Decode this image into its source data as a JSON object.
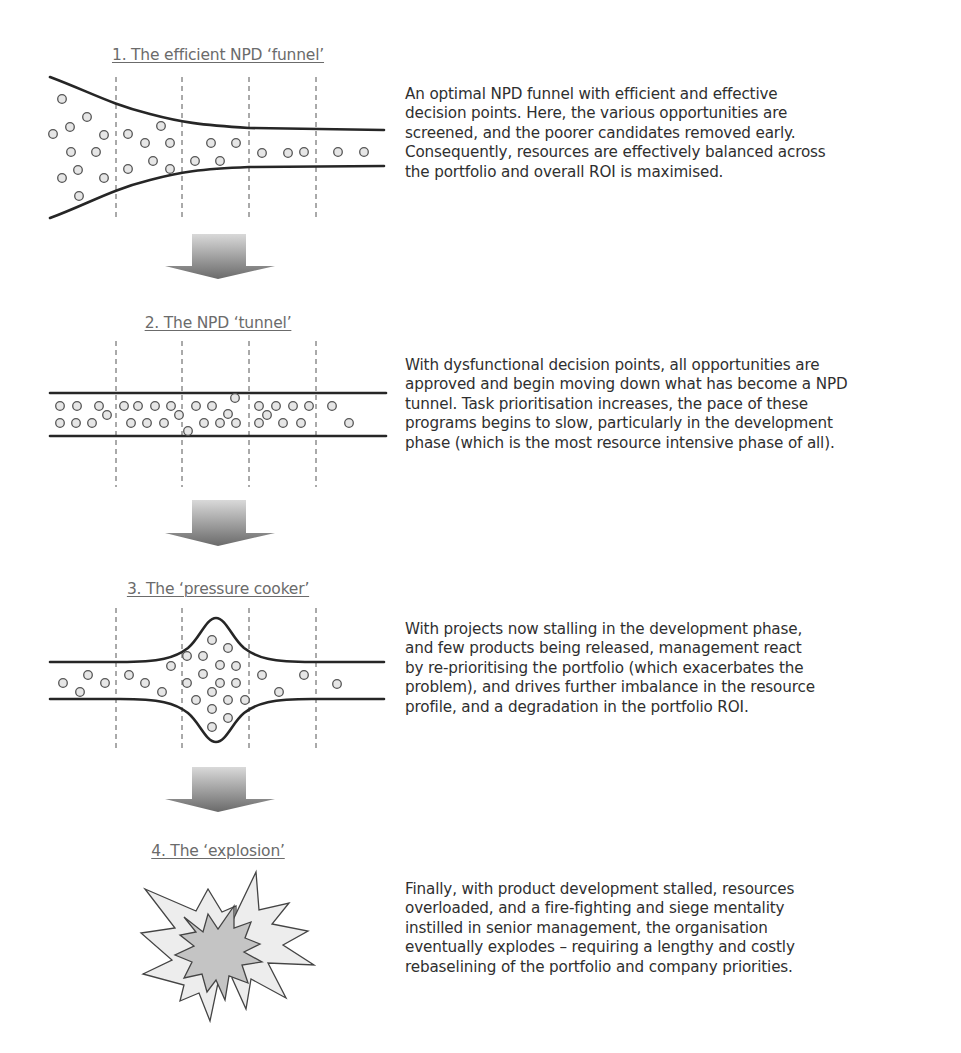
{
  "diagram": {
    "stages": [
      {
        "id": 1,
        "title": "1. The efficient NPD ‘funnel’",
        "description_lines": [
          "An optimal NPD funnel with efficient and effective",
          "decision points. Here, the various opportunities are",
          "screened, and the poorer candidates removed early.",
          "Consequently, resources are effectively balanced across",
          "the portfolio and overall ROI is maximised."
        ]
      },
      {
        "id": 2,
        "title": "2. The NPD ‘tunnel’",
        "description_lines": [
          "With dysfunctional decision points, all opportunities are",
          "approved and begin moving down what has become a NPD",
          "tunnel. Task prioritisation increases, the pace of these",
          "programs begins to slow, particularly in the development",
          "phase (which is the most resource intensive phase of all)."
        ]
      },
      {
        "id": 3,
        "title": "3. The ‘pressure cooker’",
        "description_lines": [
          "With projects now stalling in the development phase,",
          "and few products being released, management react",
          "by re-prioritising the portfolio (which exacerbates the",
          "problem), and drives further imbalance in the resource",
          "profile, and a degradation in the portfolio ROI."
        ]
      },
      {
        "id": 4,
        "title": "4. The ‘explosion’",
        "description_lines": [
          "Finally, with product development stalled, resources",
          "overloaded, and a fire-fighting and siege mentality",
          "instilled in senior management, the organisation",
          "eventually explodes – requiring a lengthy and costly",
          "rebaselining of the portfolio and company priorities."
        ]
      }
    ],
    "icons": {
      "transition_arrow": "down-arrow-icon",
      "opportunity": "circle-icon",
      "decision_gate": "dashed-line",
      "explosion": "starburst-icon"
    },
    "colors": {
      "rail": "#262626",
      "dot_fill": "#e6e6e6",
      "title_text": "#6b6b6b",
      "body_text": "#2f2f2f",
      "explosion_outer": "#ececec",
      "explosion_inner": "#c4c4c4",
      "arrow_top": "#d8d8d8",
      "arrow_bottom": "#6a6a6a"
    }
  }
}
